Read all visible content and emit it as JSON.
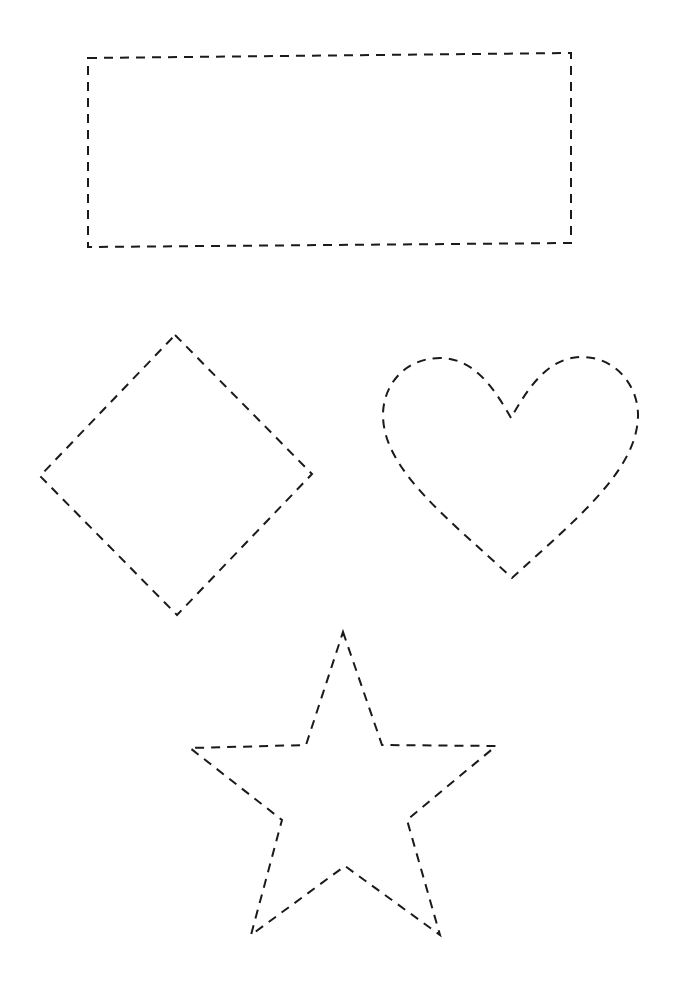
{
  "worksheet": {
    "description": "Dashed-outline tracing shapes",
    "stroke_color": "#1a1a1a",
    "background_color": "#ffffff",
    "shapes": [
      {
        "name": "rectangle",
        "style": "dashed-outline",
        "points": [
          [
            88,
            58
          ],
          [
            571,
            53
          ],
          [
            571,
            243
          ],
          [
            88,
            247
          ]
        ]
      },
      {
        "name": "diamond",
        "style": "dashed-outline",
        "points": [
          [
            175,
            335
          ],
          [
            312,
            474
          ],
          [
            177,
            615
          ],
          [
            40,
            476
          ]
        ]
      },
      {
        "name": "heart",
        "style": "dashed-outline",
        "notch": [
          511,
          418
        ],
        "bottom": [
          512,
          578
        ],
        "left_x": 383,
        "right_x": 638,
        "top_y": 357
      },
      {
        "name": "star",
        "style": "dashed-outline",
        "points": [
          [
            343,
            632
          ],
          [
            382,
            745
          ],
          [
            496,
            746
          ],
          [
            407,
            820
          ],
          [
            440,
            935
          ],
          [
            345,
            866
          ],
          [
            251,
            935
          ],
          [
            282,
            820
          ],
          [
            190,
            748
          ],
          [
            306,
            745
          ]
        ]
      }
    ]
  }
}
